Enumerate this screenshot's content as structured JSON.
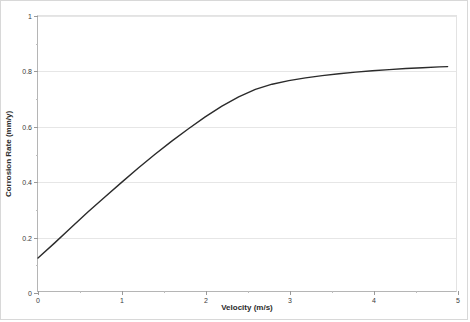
{
  "chart_data": {
    "type": "line",
    "title": "",
    "xlabel": "Velocity (m/s)",
    "ylabel": "Corrosion Rate (mm/y)",
    "xlim": [
      0,
      5
    ],
    "ylim": [
      0,
      1
    ],
    "xticks": [
      0,
      1,
      2,
      3,
      4,
      5
    ],
    "xtick_labels": [
      "0",
      "1",
      "2",
      "3",
      "4",
      "5"
    ],
    "yticks": [
      0,
      0.2,
      0.4,
      0.6,
      0.8,
      1
    ],
    "ytick_labels": [
      "0",
      "0.2",
      "0.4",
      "0.6",
      "0.8",
      "1"
    ],
    "x_minor_ticks": [
      0.5,
      1.5,
      2.5,
      3.5,
      4.5
    ],
    "y_minor_ticks": [
      0.1,
      0.3,
      0.5,
      0.7,
      0.9
    ],
    "grid": "horizontal",
    "legend": "none",
    "series": [
      {
        "name": "Corrosion Rate",
        "color": "#2b2b2b",
        "line_width": 1.4,
        "x": [
          0,
          0.2,
          0.4,
          0.6,
          0.8,
          1.0,
          1.2,
          1.4,
          1.6,
          1.8,
          2.0,
          2.2,
          2.4,
          2.6,
          2.8,
          3.0,
          3.2,
          3.4,
          3.6,
          3.8,
          4.0,
          4.2,
          4.4,
          4.6,
          4.8,
          4.9
        ],
        "values": [
          0.12,
          0.175,
          0.232,
          0.288,
          0.342,
          0.395,
          0.447,
          0.497,
          0.545,
          0.59,
          0.633,
          0.672,
          0.706,
          0.733,
          0.752,
          0.765,
          0.775,
          0.783,
          0.79,
          0.796,
          0.801,
          0.805,
          0.809,
          0.812,
          0.815,
          0.816
        ]
      }
    ]
  },
  "axis_titles": {
    "x": "Velocity (m/s)",
    "y": "Corrosion Rate (mm/y)"
  },
  "colors": {
    "series_line": "#2b2b2b",
    "gridline": "#e6e6e6",
    "axis": "#b5b5b5",
    "frame_border": "#d8d8d8",
    "tick_text": "#3a3a3a"
  }
}
